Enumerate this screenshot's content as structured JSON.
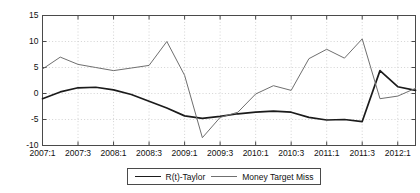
{
  "chart_data": {
    "type": "line",
    "title": "",
    "subtitle": "",
    "xlabel": "",
    "ylabel": "",
    "grid": true,
    "legend_position": "bottom-center",
    "ylim": [
      -10,
      15
    ],
    "yticks": [
      15,
      10,
      5,
      0,
      -5,
      -10
    ],
    "ytick_labels": [
      "15",
      "10",
      "5",
      "0",
      "-5",
      "-10"
    ],
    "xtick_labels": [
      "2007:1",
      "2007:3",
      "2008:1",
      "2008:3",
      "2009:1",
      "2009:3",
      "2010:1",
      "2010:3",
      "2011:1",
      "2011:3",
      "2012:1"
    ],
    "x": [
      "2007:1",
      "2007:2",
      "2007:3",
      "2007:4",
      "2008:1",
      "2008:2",
      "2008:3",
      "2008:4",
      "2009:1",
      "2009:2",
      "2009:3",
      "2009:4",
      "2010:1",
      "2010:2",
      "2010:3",
      "2010:4",
      "2011:1",
      "2011:2",
      "2011:3",
      "2011:4",
      "2012:1",
      "2012:2"
    ],
    "series": [
      {
        "name": "R(t)-Taylor",
        "color": "#1b1b1b",
        "width": 1.7,
        "values": [
          -1.0,
          0.3,
          1.1,
          1.2,
          0.7,
          -0.2,
          -1.5,
          -2.8,
          -4.3,
          -4.8,
          -4.4,
          -3.9,
          -3.6,
          -3.4,
          -3.6,
          -4.6,
          -5.1,
          -5.0,
          -5.4,
          4.4,
          1.3,
          0.6
        ]
      },
      {
        "name": "Money Target Miss",
        "color": "#6f6f6f",
        "width": 1.0,
        "values": [
          4.7,
          7.0,
          5.6,
          5.0,
          4.4,
          4.9,
          5.4,
          10.0,
          3.5,
          -8.5,
          -4.6,
          -3.6,
          -0.1,
          1.5,
          0.6,
          6.7,
          8.5,
          6.8,
          10.5,
          -1.0,
          -0.5,
          1.0
        ]
      }
    ]
  },
  "legend": {
    "entries": [
      {
        "label": "R(t)-Taylor",
        "style": "thick"
      },
      {
        "label": "Money Target Miss",
        "style": "thin"
      }
    ]
  },
  "axes": {
    "frame_color": "#4a4a4a",
    "grid_color": "#c8c8c8"
  }
}
